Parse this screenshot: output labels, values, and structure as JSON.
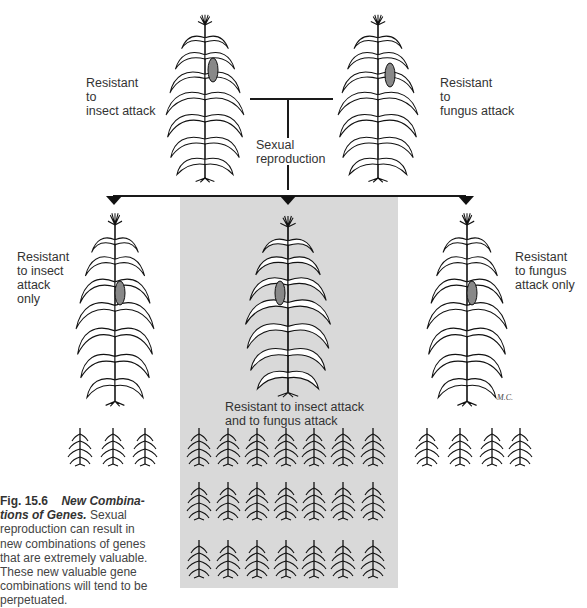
{
  "figure": {
    "number": "Fig. 15.6",
    "title_line1": "New Combina-",
    "title_line2": "tions of Genes.",
    "caption_body_lines": [
      "Sexual",
      "reproduction can result in",
      "new combinations of genes",
      "that are extremely valuable.",
      "These new valuable gene",
      "combinations will tend to be",
      "perpetuated."
    ]
  },
  "parents": {
    "left": {
      "label_lines": [
        "Resistant",
        "to",
        "insect attack"
      ]
    },
    "right": {
      "label_lines": [
        "Resistant",
        "to",
        "fungus attack"
      ]
    }
  },
  "process": {
    "label_lines": [
      "Sexual",
      "reproduction"
    ]
  },
  "offspring": {
    "left": {
      "label_lines": [
        "Resistant",
        "to insect",
        "attack",
        "only"
      ],
      "seedling_count": 3
    },
    "center": {
      "label_lines": [
        "Resistant to insect attack",
        "and to fungus attack"
      ],
      "seedling_rows": 3,
      "seedlings_per_row": 7,
      "highlight_color": "#d9d9d9"
    },
    "right": {
      "label_lines": [
        "Resistant",
        "to fungus",
        "attack only"
      ],
      "seedling_count": 4
    }
  },
  "artist_signature": "M.C."
}
